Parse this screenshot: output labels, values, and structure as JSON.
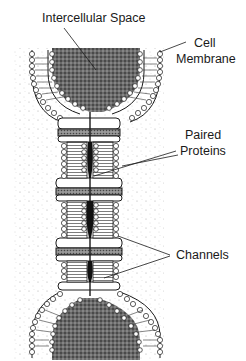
{
  "diagram": {
    "type": "labeled-illustration",
    "colors": {
      "ink": "#1a1a1a",
      "background": "#ffffff",
      "stipple": "#9a9a9a",
      "dense_fill": "#555555"
    },
    "labels": {
      "intercellular_space": "Intercellular Space",
      "cell_line1": "Cell",
      "cell_line2": "Membrane",
      "paired_line1": "Paired",
      "paired_line2": "Proteins",
      "channels": "Channels"
    }
  }
}
